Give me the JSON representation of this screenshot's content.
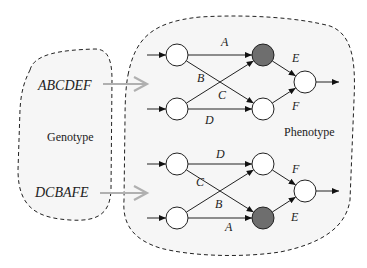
{
  "genotype": {
    "label": "Genotype",
    "sequences": [
      "ABCDEF",
      "DCBAFE"
    ]
  },
  "phenotype": {
    "label": "Phenotype"
  },
  "networks": [
    {
      "edges": [
        {
          "label": "A",
          "from": "in1",
          "to": "mid1"
        },
        {
          "label": "B",
          "from": "in1",
          "to": "mid2"
        },
        {
          "label": "C",
          "from": "in2",
          "to": "mid1"
        },
        {
          "label": "D",
          "from": "in2",
          "to": "mid2"
        },
        {
          "label": "E",
          "from": "mid1",
          "to": "out"
        },
        {
          "label": "F",
          "from": "mid2",
          "to": "out"
        }
      ],
      "highlighted_node": "mid1"
    },
    {
      "edges": [
        {
          "label": "D",
          "from": "in1",
          "to": "mid1"
        },
        {
          "label": "C",
          "from": "in1",
          "to": "mid2"
        },
        {
          "label": "B",
          "from": "in2",
          "to": "mid1"
        },
        {
          "label": "A",
          "from": "in2",
          "to": "mid2"
        },
        {
          "label": "F",
          "from": "mid1",
          "to": "out"
        },
        {
          "label": "E",
          "from": "mid2",
          "to": "out"
        }
      ],
      "highlighted_node": "mid2"
    }
  ],
  "colors": {
    "highlight_node": "#6e6e6e",
    "mapping_arrow": "#b0b0b0",
    "region_fill": "#f6f6f6"
  }
}
